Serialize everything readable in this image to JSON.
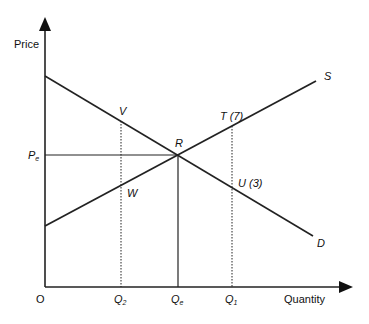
{
  "diagram": {
    "type": "supply-demand",
    "axes": {
      "y_label": "Price",
      "x_label": "Quantity",
      "origin_label": "O"
    },
    "curves": {
      "supply_label": "S",
      "demand_label": "D"
    },
    "equilibrium": {
      "point_label": "R",
      "price_label": "P",
      "price_sub": "e",
      "quantity_label": "Q",
      "quantity_sub": "e"
    },
    "quantities": {
      "q2_label": "Q",
      "q2_sub": "2",
      "q1_label": "Q",
      "q1_sub": "1"
    },
    "points": {
      "V": "V",
      "W": "W",
      "T": "T (7)",
      "U": "U (3)"
    },
    "colors": {
      "line": "#222222",
      "text": "#111111",
      "background": "#ffffff"
    }
  }
}
